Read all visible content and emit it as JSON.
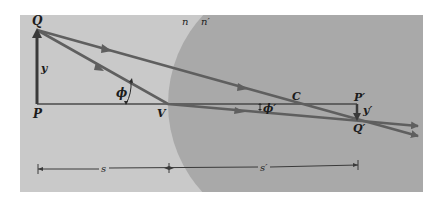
{
  "diagram": {
    "type": "optics-ray-diagram",
    "colors": {
      "background": "#ffffff",
      "medium_n": "#c9c9c9",
      "medium_n_prime": "#a9a9a9",
      "ray": "#5f5f5f",
      "object": "#3a3a3a",
      "axis": "#4a4a4a"
    },
    "media": {
      "n": "n",
      "n_prime": "n′"
    },
    "points": {
      "Q": "Q",
      "P": "P",
      "V": "V",
      "C": "C",
      "P_prime": "P′",
      "Q_prime": "Q′"
    },
    "lengths": {
      "y": "y",
      "y_prime": "y′",
      "s": "s",
      "s_prime": "s′"
    },
    "angles": {
      "phi": "ϕ",
      "phi_prime": "ϕ′"
    }
  }
}
